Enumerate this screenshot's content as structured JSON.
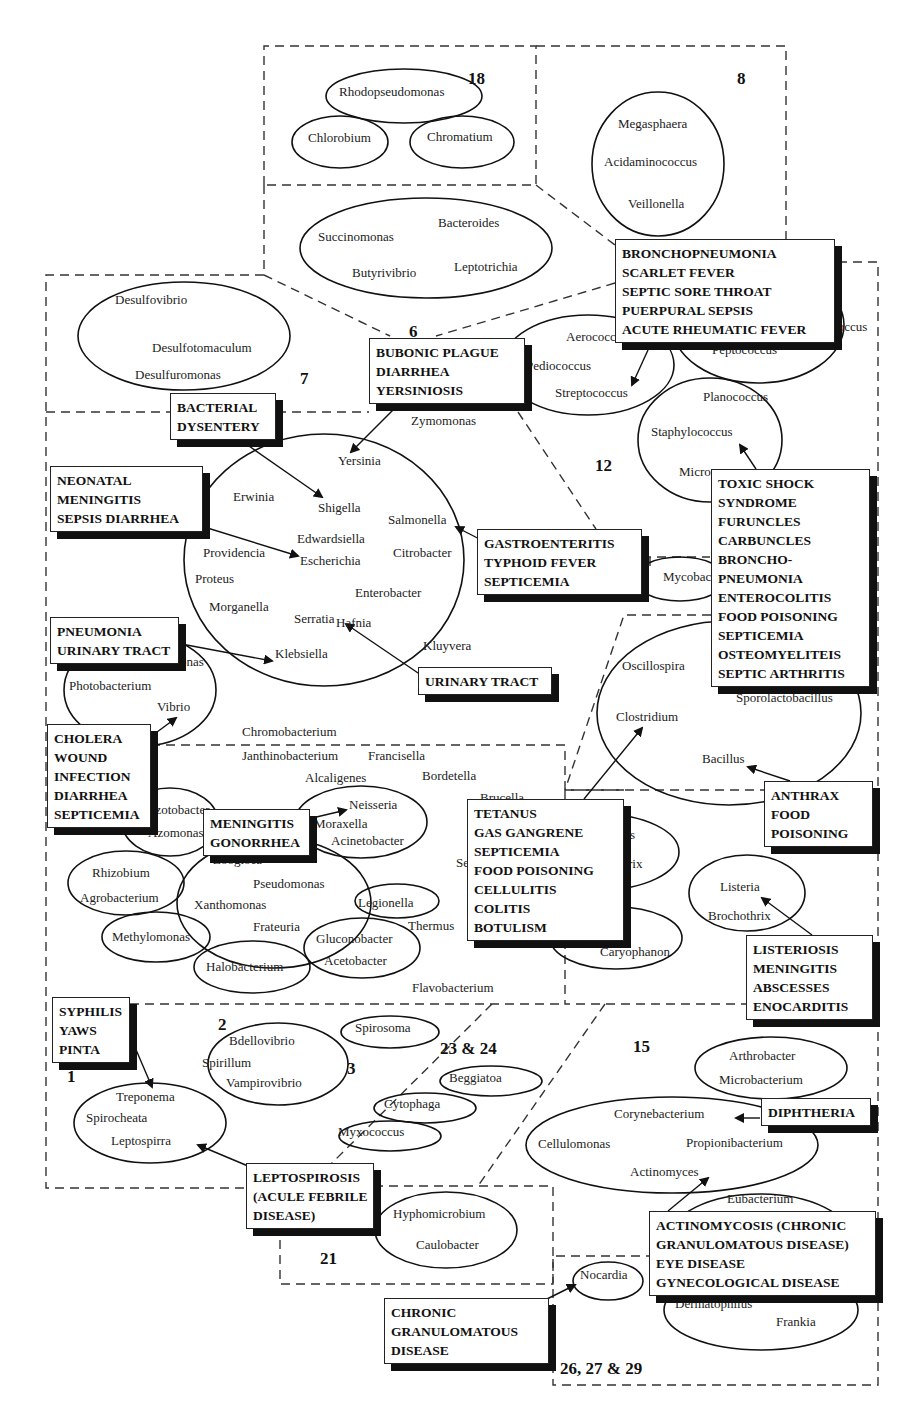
{
  "diagram": {
    "corner_mark": "ʼʼ",
    "group_numbers": [
      {
        "id": "g18",
        "label": "18",
        "x": 468,
        "y": 70
      },
      {
        "id": "g8",
        "label": "8",
        "x": 737,
        "y": 70
      },
      {
        "id": "g6",
        "label": "6",
        "x": 409,
        "y": 323
      },
      {
        "id": "g7",
        "label": "7",
        "x": 300,
        "y": 370
      },
      {
        "id": "g12",
        "label": "12",
        "x": 595,
        "y": 457
      },
      {
        "id": "g2",
        "label": "2",
        "x": 218,
        "y": 1016
      },
      {
        "id": "g3",
        "label": "3",
        "x": 347,
        "y": 1060
      },
      {
        "id": "g1",
        "label": "1",
        "x": 67,
        "y": 1068
      },
      {
        "id": "g23-24",
        "label": "23 & 24",
        "x": 440,
        "y": 1040
      },
      {
        "id": "g15",
        "label": "15",
        "x": 633,
        "y": 1038
      },
      {
        "id": "g21",
        "label": "21",
        "x": 320,
        "y": 1250
      },
      {
        "id": "g26-27-29",
        "label": "26, 27 & 29",
        "x": 560,
        "y": 1360
      }
    ],
    "genera": [
      {
        "name": "Rhodopseudomonas",
        "x": 339,
        "y": 90
      },
      {
        "name": "Chlorobium",
        "x": 308,
        "y": 136
      },
      {
        "name": "Chromatium",
        "x": 427,
        "y": 135
      },
      {
        "name": "Megasphaera",
        "x": 618,
        "y": 122
      },
      {
        "name": "Acidaminococcus",
        "x": 604,
        "y": 160
      },
      {
        "name": "Veillonella",
        "x": 628,
        "y": 202
      },
      {
        "name": "Bacteroides",
        "x": 438,
        "y": 221
      },
      {
        "name": "Succinomonas",
        "x": 318,
        "y": 235
      },
      {
        "name": "Butyrivibrio",
        "x": 352,
        "y": 271
      },
      {
        "name": "Leptotrichia",
        "x": 454,
        "y": 265
      },
      {
        "name": "Desulfovibrio",
        "x": 115,
        "y": 298
      },
      {
        "name": "Desulfotomaculum",
        "x": 152,
        "y": 346
      },
      {
        "name": "Desulfuromonas",
        "x": 135,
        "y": 373
      },
      {
        "name": "Aerococcus",
        "x": 566,
        "y": 335
      },
      {
        "name": "Pediococcus",
        "x": 526,
        "y": 364
      },
      {
        "name": "Streptococcus",
        "x": 555,
        "y": 391
      },
      {
        "name": "Peptococcus",
        "x": 712,
        "y": 348
      },
      {
        "name": "Ruminococcus",
        "x": 790,
        "y": 325
      },
      {
        "name": "Zymomonas",
        "x": 411,
        "y": 419
      },
      {
        "name": "Planococcus",
        "x": 703,
        "y": 395
      },
      {
        "name": "Staphylococcus",
        "x": 651,
        "y": 430
      },
      {
        "name": "Micrococcus",
        "x": 679,
        "y": 470
      },
      {
        "name": "Yersinia",
        "x": 338,
        "y": 459
      },
      {
        "name": "Erwinia",
        "x": 233,
        "y": 495
      },
      {
        "name": "Shigella",
        "x": 318,
        "y": 506
      },
      {
        "name": "Salmonella",
        "x": 388,
        "y": 518
      },
      {
        "name": "Edwardsiella",
        "x": 297,
        "y": 537
      },
      {
        "name": "Providencia",
        "x": 203,
        "y": 551
      },
      {
        "name": "Escherichia",
        "x": 300,
        "y": 559
      },
      {
        "name": "Citrobacter",
        "x": 393,
        "y": 551
      },
      {
        "name": "Proteus",
        "x": 195,
        "y": 577
      },
      {
        "name": "Enterobacter",
        "x": 355,
        "y": 591
      },
      {
        "name": "Morganella",
        "x": 209,
        "y": 605
      },
      {
        "name": "Serratia",
        "x": 294,
        "y": 617
      },
      {
        "name": "Hafnia",
        "x": 336,
        "y": 621
      },
      {
        "name": "Mycobacterium",
        "x": 663,
        "y": 575
      },
      {
        "name": "Kluyvera",
        "x": 423,
        "y": 644
      },
      {
        "name": "Klebsiella",
        "x": 275,
        "y": 652
      },
      {
        "name": "Plesiomonas",
        "x": 138,
        "y": 660
      },
      {
        "name": "Photobacterium",
        "x": 69,
        "y": 684
      },
      {
        "name": "Vibrio",
        "x": 157,
        "y": 705
      },
      {
        "name": "Oscillospira",
        "x": 622,
        "y": 664
      },
      {
        "name": "Clostridium",
        "x": 616,
        "y": 715
      },
      {
        "name": "Sporolactobacillus",
        "x": 736,
        "y": 696
      },
      {
        "name": "Bacillus",
        "x": 702,
        "y": 757
      },
      {
        "name": "Chromobacterium",
        "x": 242,
        "y": 730
      },
      {
        "name": "Janthinobacterium",
        "x": 242,
        "y": 754
      },
      {
        "name": "Francisella",
        "x": 368,
        "y": 754
      },
      {
        "name": "Alcaligenes",
        "x": 305,
        "y": 776
      },
      {
        "name": "Bordetella",
        "x": 422,
        "y": 774
      },
      {
        "name": "Brucella",
        "x": 480,
        "y": 796
      },
      {
        "name": "Azotobacter",
        "x": 146,
        "y": 808
      },
      {
        "name": "Azomonas",
        "x": 148,
        "y": 831
      },
      {
        "name": "Neisseria",
        "x": 349,
        "y": 803
      },
      {
        "name": "Moraxella",
        "x": 314,
        "y": 822
      },
      {
        "name": "Acinetobacter",
        "x": 331,
        "y": 839
      },
      {
        "name": "Zoogloea",
        "x": 213,
        "y": 858
      },
      {
        "name": "Serpens",
        "x": 456,
        "y": 861
      },
      {
        "name": "Rhizobium",
        "x": 92,
        "y": 871
      },
      {
        "name": "Pseudomonas",
        "x": 253,
        "y": 882
      },
      {
        "name": "Agrobacterium",
        "x": 80,
        "y": 896
      },
      {
        "name": "Xanthomonas",
        "x": 194,
        "y": 903
      },
      {
        "name": "Legionella",
        "x": 358,
        "y": 901
      },
      {
        "name": "Frateuria",
        "x": 253,
        "y": 925
      },
      {
        "name": "Thermus",
        "x": 408,
        "y": 924
      },
      {
        "name": "Methylomonas",
        "x": 112,
        "y": 935
      },
      {
        "name": "Gluconobacter",
        "x": 316,
        "y": 937
      },
      {
        "name": "Acetobacter",
        "x": 324,
        "y": 959
      },
      {
        "name": "Halobacterium",
        "x": 206,
        "y": 965
      },
      {
        "name": "Flavobacterium",
        "x": 412,
        "y": 986
      },
      {
        "name": "Lactobacillus",
        "x": 565,
        "y": 833
      },
      {
        "name": "Erysipelothrix",
        "x": 568,
        "y": 862
      },
      {
        "name": "Listeria",
        "x": 720,
        "y": 885
      },
      {
        "name": "Brochothrix",
        "x": 708,
        "y": 914
      },
      {
        "name": "Kurthia",
        "x": 591,
        "y": 926
      },
      {
        "name": "Caryophanon",
        "x": 600,
        "y": 950
      },
      {
        "name": "Spirosoma",
        "x": 355,
        "y": 1026
      },
      {
        "name": "Bdellovibrio",
        "x": 229,
        "y": 1039
      },
      {
        "name": "Spirillum",
        "x": 202,
        "y": 1061
      },
      {
        "name": "Vampirovibrio",
        "x": 226,
        "y": 1081
      },
      {
        "name": "Beggiatoa",
        "x": 449,
        "y": 1076
      },
      {
        "name": "Cytophaga",
        "x": 384,
        "y": 1102
      },
      {
        "name": "Treponema",
        "x": 116,
        "y": 1095
      },
      {
        "name": "Spirocheata",
        "x": 86,
        "y": 1116
      },
      {
        "name": "Myxococcus",
        "x": 338,
        "y": 1130
      },
      {
        "name": "Leptospirra",
        "x": 111,
        "y": 1139
      },
      {
        "name": "Arthrobacter",
        "x": 729,
        "y": 1054
      },
      {
        "name": "Microbacterium",
        "x": 719,
        "y": 1078
      },
      {
        "name": "Corynebacterium",
        "x": 614,
        "y": 1112
      },
      {
        "name": "Cellulomonas",
        "x": 538,
        "y": 1142
      },
      {
        "name": "Propionibacterium",
        "x": 686,
        "y": 1141
      },
      {
        "name": "Actinomyces",
        "x": 630,
        "y": 1170
      },
      {
        "name": "Eubacterium",
        "x": 727,
        "y": 1197
      },
      {
        "name": "Hyphomicrobium",
        "x": 393,
        "y": 1212
      },
      {
        "name": "Caulobacter",
        "x": 416,
        "y": 1243
      },
      {
        "name": "Nocardia",
        "x": 580,
        "y": 1273
      },
      {
        "name": "Dermatophilus",
        "x": 675,
        "y": 1302
      },
      {
        "name": "Frankia",
        "x": 776,
        "y": 1320
      }
    ],
    "disease_boxes": [
      {
        "id": "strep-diseases",
        "x": 615,
        "y": 239,
        "w": 220,
        "lines": [
          "BRONCHOPNEUMONIA",
          "SCARLET FEVER",
          "SEPTIC SORE THROAT",
          "PUERPURAL SEPSIS",
          "ACUTE RHEUMATIC FEVER"
        ]
      },
      {
        "id": "yersinia-diseases",
        "x": 369,
        "y": 338,
        "w": 156,
        "lines": [
          "BUBONIC PLAGUE",
          "DIARRHEA",
          "YERSINIOSIS"
        ]
      },
      {
        "id": "shigella-diseases",
        "x": 170,
        "y": 393,
        "w": 106,
        "lines": [
          "BACTERIAL",
          "DYSENTERY"
        ]
      },
      {
        "id": "escherichia-diseases",
        "x": 50,
        "y": 466,
        "w": 153,
        "lines": [
          "NEONATAL",
          "MENINGITIS",
          "SEPSIS DIARRHEA"
        ]
      },
      {
        "id": "salmonella-diseases",
        "x": 477,
        "y": 529,
        "w": 165,
        "lines": [
          "GASTROENTERITIS",
          "TYPHOID FEVER",
          "SEPTICEMIA"
        ]
      },
      {
        "id": "staph-diseases",
        "x": 711,
        "y": 469,
        "w": 159,
        "lines": [
          "TOXIC SHOCK",
          "SYNDROME",
          "FURUNCLES",
          "CARBUNCLES",
          "BRONCHO-",
          "PNEUMONIA",
          "ENTEROCOLITIS",
          "FOOD POISONING",
          "SEPTICEMIA",
          "OSTEOMYELITEIS",
          "SEPTIC ARTHRITIS"
        ]
      },
      {
        "id": "klebsiella-diseases",
        "x": 50,
        "y": 617,
        "w": 129,
        "lines": [
          "PNEUMONIA",
          "URINARY TRACT"
        ]
      },
      {
        "id": "serratia-diseases",
        "x": 418,
        "y": 667,
        "w": 134,
        "lines": [
          "URINARY TRACT"
        ]
      },
      {
        "id": "vibrio-diseases",
        "x": 47,
        "y": 724,
        "w": 104,
        "lines": [
          "CHOLERA",
          "WOUND",
          "INFECTION",
          "DIARRHEA",
          "SEPTICEMIA"
        ]
      },
      {
        "id": "neisseria-diseases",
        "x": 203,
        "y": 809,
        "w": 107,
        "lines": [
          "MENINGITIS",
          "GONORRHEA"
        ]
      },
      {
        "id": "clostridium-diseases",
        "x": 467,
        "y": 799,
        "w": 157,
        "lines": [
          "TETANUS",
          "GAS GANGRENE",
          "SEPTICEMIA",
          "FOOD POISONING",
          "CELLULITIS",
          "COLITIS",
          "BOTULISM"
        ]
      },
      {
        "id": "bacillus-diseases",
        "x": 764,
        "y": 781,
        "w": 109,
        "lines": [
          "ANTHRAX",
          "FOOD",
          "POISONING"
        ]
      },
      {
        "id": "listeria-diseases",
        "x": 746,
        "y": 935,
        "w": 127,
        "lines": [
          "LISTERIOSIS",
          "MENINGITIS",
          "ABSCESSES",
          "ENOCARDITIS"
        ]
      },
      {
        "id": "treponema-diseases",
        "x": 52,
        "y": 997,
        "w": 78,
        "lines": [
          "SYPHILIS",
          "YAWS",
          "PINTA"
        ]
      },
      {
        "id": "leptospira-diseases",
        "x": 246,
        "y": 1163,
        "w": 128,
        "lines": [
          "LEPTOSPIROSIS",
          "(ACULE FEBRILE",
          "DISEASE)"
        ]
      },
      {
        "id": "corynebacterium-diseases",
        "x": 761,
        "y": 1098,
        "w": 110,
        "lines": [
          "DIPHTHERIA"
        ]
      },
      {
        "id": "actinomyces-diseases",
        "x": 649,
        "y": 1211,
        "w": 227,
        "lines": [
          "ACTINOMYCOSIS (CHRONIC",
          "GRANULOMATOUS DISEASE)",
          "EYE DISEASE",
          "GYNECOLOGICAL DISEASE"
        ]
      },
      {
        "id": "nocardia-diseases",
        "x": 384,
        "y": 1298,
        "w": 165,
        "lines": [
          "CHRONIC",
          "GRANULOMATOUS",
          "DISEASE"
        ]
      }
    ]
  }
}
